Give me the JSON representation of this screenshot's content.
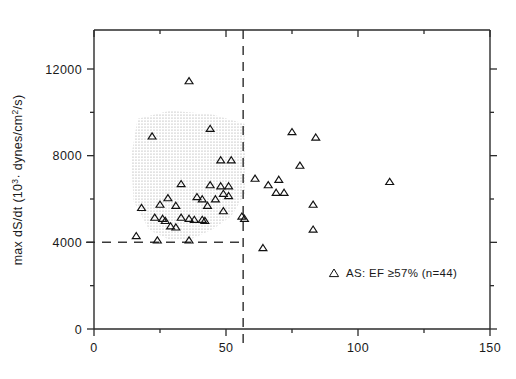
{
  "chart_data": {
    "type": "scatter",
    "title": "",
    "xlabel": "",
    "ylabel": "max dS/dt (10³· dynes/cm²/s)",
    "ylabel_parts": {
      "prefix": "max dS/dt (10",
      "superscript": "3",
      "suffix": "· dynes/cm",
      "superscript2": "2",
      "suffix2": "/s)"
    },
    "xlim": [
      0,
      150
    ],
    "ylim": [
      0,
      13800
    ],
    "x_ticks": [
      0,
      50,
      100,
      150
    ],
    "x_tick_labels": [
      "0",
      "50",
      "100",
      "150"
    ],
    "x_minor_ticks": [
      25,
      75,
      125
    ],
    "y_ticks": [
      0,
      4000,
      8000,
      12000
    ],
    "y_tick_labels": [
      "0",
      "4000",
      "8000",
      "12000"
    ],
    "y_minor_ticks": [
      2000,
      6000,
      10000
    ],
    "grid": false,
    "legend_position": "inside-lower-right",
    "legend": [
      {
        "marker": "triangle-up-open",
        "label": "AS: EF ≥57%  (n=44)"
      }
    ],
    "annotations": [
      {
        "name": "vertical-threshold-line",
        "type": "vline",
        "x": 56.5,
        "style": "dashed"
      },
      {
        "name": "horizontal-threshold-line",
        "type": "hline",
        "y": 4000,
        "x_start": 0,
        "x_end": 56.5,
        "style": "dashed"
      },
      {
        "name": "shaded-normal-range-region",
        "type": "polygon-shaded",
        "points": [
          [
            16.5,
            9700
          ],
          [
            29,
            10080
          ],
          [
            45,
            9900
          ],
          [
            57,
            9470
          ],
          [
            57.5,
            6300
          ],
          [
            52,
            5200
          ],
          [
            45,
            4600
          ],
          [
            37,
            4150
          ],
          [
            29,
            4100
          ],
          [
            21,
            4560
          ],
          [
            15,
            5900
          ],
          [
            14,
            7900
          ]
        ]
      }
    ],
    "series": [
      {
        "name": "AS: EF ≥57%",
        "marker": "triangle-up-open",
        "n": 44,
        "points": [
          [
            36,
            11450
          ],
          [
            22,
            8900
          ],
          [
            44,
            9250
          ],
          [
            48,
            7800
          ],
          [
            52,
            7800
          ],
          [
            33,
            6700
          ],
          [
            44,
            6650
          ],
          [
            48,
            6600
          ],
          [
            51,
            6600
          ],
          [
            49,
            6250
          ],
          [
            51,
            6150
          ],
          [
            39,
            6100
          ],
          [
            41,
            6000
          ],
          [
            46,
            6000
          ],
          [
            28,
            6050
          ],
          [
            25,
            5750
          ],
          [
            31,
            5700
          ],
          [
            43,
            5700
          ],
          [
            49,
            5450
          ],
          [
            18,
            5600
          ],
          [
            23,
            5150
          ],
          [
            26,
            5100
          ],
          [
            27,
            5000
          ],
          [
            33,
            5150
          ],
          [
            36,
            5100
          ],
          [
            38,
            5050
          ],
          [
            41,
            5050
          ],
          [
            42,
            5000
          ],
          [
            29,
            4750
          ],
          [
            31,
            4700
          ],
          [
            16,
            4300
          ],
          [
            24,
            4100
          ],
          [
            36,
            4100
          ],
          [
            56,
            5200
          ],
          [
            57,
            5100
          ],
          [
            61,
            6950
          ],
          [
            66,
            6650
          ],
          [
            70,
            6900
          ],
          [
            75,
            9100
          ],
          [
            78,
            7550
          ],
          [
            69,
            6300
          ],
          [
            72,
            6300
          ],
          [
            84,
            8850
          ],
          [
            83,
            5750
          ],
          [
            83,
            4600
          ],
          [
            64,
            3750
          ],
          [
            112,
            6800
          ]
        ]
      }
    ]
  },
  "axis": {
    "y_title_text": "max dS/dt (10³· dynes/cm²/s)"
  }
}
